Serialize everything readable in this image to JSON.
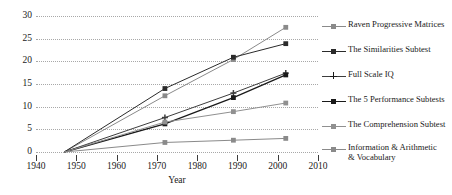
{
  "chart_data": {
    "type": "line",
    "title": "",
    "xlabel": "Year",
    "ylabel": "",
    "xlim": [
      1940,
      2010
    ],
    "ylim": [
      0,
      30
    ],
    "xticks": [
      1940,
      1950,
      1960,
      1970,
      1980,
      1990,
      2000,
      2010
    ],
    "yticks": [
      0,
      5,
      10,
      15,
      20,
      25,
      30
    ],
    "grid": true,
    "legend_position": "right",
    "x": [
      1947,
      1972,
      1989,
      2002
    ],
    "series": [
      {
        "name": "Raven Progressive Matrices",
        "color": "#8a8a8a",
        "marker": "square",
        "values": [
          0,
          12.4,
          20.4,
          27.5
        ]
      },
      {
        "name": "The Similarities Subtest",
        "color": "#2b2b2b",
        "marker": "square",
        "values": [
          0,
          14.0,
          20.9,
          23.9
        ]
      },
      {
        "name": "Full Scale IQ",
        "color": "#3d3d3d",
        "marker": "cross",
        "values": [
          0,
          7.6,
          13.0,
          17.4
        ]
      },
      {
        "name": "The 5 Performance Subtests",
        "color": "#1a1a1a",
        "marker": "square",
        "values": [
          0,
          6.2,
          12.0,
          17.0
        ]
      },
      {
        "name": "The Comprehension Subtest",
        "color": "#909090",
        "marker": "square",
        "values": [
          0,
          6.6,
          8.9,
          10.8
        ]
      },
      {
        "name": "Information & Arithmetic\n& Vocabulary",
        "color": "#8a8a8a",
        "marker": "square",
        "values": [
          0,
          2.1,
          2.6,
          3.0
        ]
      }
    ]
  },
  "axis": {
    "y_labels": [
      "30",
      "25",
      "20",
      "15",
      "10",
      "5",
      "0"
    ],
    "x_labels": [
      "1940",
      "1950",
      "1960",
      "1970",
      "1980",
      "1990",
      "2000",
      "2010"
    ],
    "x_title": "Year"
  },
  "legend": {
    "items": [
      {
        "label": "Raven Progressive Matrices"
      },
      {
        "label": "The Similarities Subtest"
      },
      {
        "label": "Full Scale IQ"
      },
      {
        "label": "The 5 Performance Subtests"
      },
      {
        "label": "The Comprehension Subtest"
      },
      {
        "label": "Information & Arithmetic\n& Vocabulary"
      }
    ]
  }
}
